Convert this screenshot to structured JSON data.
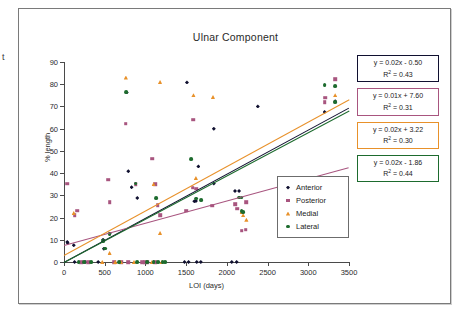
{
  "edge_fragment": "t",
  "chart_data": {
    "type": "scatter",
    "title": "Ulnar Component",
    "xlabel": "LOI (days)",
    "ylabel": "% length",
    "xlim": [
      0,
      3500
    ],
    "ylim": [
      0,
      90
    ],
    "xticks": [
      0,
      500,
      1000,
      1500,
      2000,
      2500,
      3000,
      3500
    ],
    "yticks": [
      0,
      10,
      20,
      30,
      40,
      50,
      60,
      70,
      80,
      90
    ],
    "grid": false,
    "legend_position": "inside-right",
    "series": [
      {
        "name": "Anterior",
        "marker": "diamond",
        "color": "#101030",
        "points": [
          [
            40,
            9
          ],
          [
            45,
            8.5
          ],
          [
            120,
            7.5
          ],
          [
            480,
            10
          ],
          [
            490,
            6
          ],
          [
            560,
            12.8
          ],
          [
            770,
            76.3
          ],
          [
            790,
            40.8
          ],
          [
            830,
            33.6
          ],
          [
            900,
            28.8
          ],
          [
            1510,
            80.8
          ],
          [
            1600,
            27.3
          ],
          [
            1620,
            27.5
          ],
          [
            1840,
            60
          ],
          [
            1840,
            35.3
          ],
          [
            2100,
            32
          ],
          [
            2150,
            32
          ],
          [
            2380,
            70
          ],
          [
            1650,
            43
          ],
          [
            3200,
            67.5
          ],
          [
            3330,
            72.3
          ],
          [
            1480,
            0
          ],
          [
            1530,
            0
          ],
          [
            1630,
            0
          ],
          [
            1680,
            0
          ],
          [
            2060,
            0
          ],
          [
            2120,
            0
          ],
          [
            130,
            0
          ],
          [
            260,
            0
          ],
          [
            420,
            0
          ]
        ]
      },
      {
        "name": "Posterior",
        "marker": "square",
        "color": "#a8557f",
        "points": [
          [
            40,
            35.3
          ],
          [
            160,
            23
          ],
          [
            130,
            21
          ],
          [
            560,
            27
          ],
          [
            540,
            37
          ],
          [
            760,
            62.3
          ],
          [
            880,
            35
          ],
          [
            1080,
            46.4
          ],
          [
            1120,
            35
          ],
          [
            1150,
            25.5
          ],
          [
            1180,
            21
          ],
          [
            1590,
            64
          ],
          [
            1580,
            33.5
          ],
          [
            1620,
            33
          ],
          [
            1500,
            23
          ],
          [
            1820,
            25.3
          ],
          [
            2100,
            26
          ],
          [
            2130,
            24
          ],
          [
            2240,
            27
          ],
          [
            2180,
            14
          ],
          [
            2230,
            14.5
          ],
          [
            3200,
            72
          ],
          [
            3210,
            74
          ],
          [
            3330,
            82.3
          ],
          [
            210,
            0
          ],
          [
            300,
            0
          ],
          [
            620,
            0
          ],
          [
            700,
            0
          ],
          [
            790,
            0
          ],
          [
            960,
            0
          ],
          [
            1000,
            0
          ],
          [
            1030,
            0
          ],
          [
            1120,
            0
          ]
        ]
      },
      {
        "name": "Medial",
        "marker": "triangle",
        "color": "#e8912a",
        "points": [
          [
            120,
            22
          ],
          [
            560,
            4
          ],
          [
            760,
            83
          ],
          [
            1180,
            81
          ],
          [
            1100,
            35
          ],
          [
            1180,
            13
          ],
          [
            1590,
            75
          ],
          [
            1620,
            37.8
          ],
          [
            1830,
            74.3
          ],
          [
            2180,
            22.5
          ],
          [
            2200,
            21
          ],
          [
            2240,
            19
          ],
          [
            3330,
            75
          ],
          [
            700,
            0
          ],
          [
            860,
            0
          ],
          [
            1080,
            0
          ],
          [
            1200,
            0
          ],
          [
            470,
            0
          ],
          [
            630,
            0
          ]
        ]
      },
      {
        "name": "Lateral",
        "marker": "circle",
        "color": "#1d6b2e",
        "points": [
          [
            760,
            76.3
          ],
          [
            880,
            35.3
          ],
          [
            1130,
            28.8
          ],
          [
            1560,
            46.3
          ],
          [
            1620,
            28.5
          ],
          [
            1680,
            28
          ],
          [
            2150,
            29
          ],
          [
            2180,
            29
          ],
          [
            2180,
            23
          ],
          [
            2200,
            22.5
          ],
          [
            3200,
            79.5
          ],
          [
            3330,
            79.3
          ],
          [
            3330,
            71.8
          ],
          [
            480,
            9.5
          ],
          [
            500,
            6
          ],
          [
            560,
            12.6
          ],
          [
            250,
            0
          ],
          [
            330,
            0
          ],
          [
            680,
            0
          ],
          [
            900,
            0
          ],
          [
            1020,
            0
          ],
          [
            1100,
            0
          ],
          [
            1160,
            0
          ],
          [
            1210,
            0
          ],
          [
            1240,
            0
          ],
          [
            180,
            0
          ]
        ]
      }
    ],
    "trendlines": [
      {
        "name": "Anterior",
        "color": "#101030",
        "slope": 0.02,
        "intercept": -0.5,
        "r2": 0.43,
        "equation": "y = 0.02x - 0.50",
        "r2_label": "R² = 0.43"
      },
      {
        "name": "Posterior",
        "color": "#a8557f",
        "slope": 0.01,
        "intercept": 7.6,
        "r2": 0.31,
        "equation": "y = 0.01x + 7.60",
        "r2_label": "R² = 0.31"
      },
      {
        "name": "Medial",
        "color": "#e8912a",
        "slope": 0.02,
        "intercept": 3.22,
        "r2": 0.3,
        "equation": "y = 0.02x + 3.22",
        "r2_label": "R² = 0.30"
      },
      {
        "name": "Lateral",
        "color": "#1d6b2e",
        "slope": 0.02,
        "intercept": -1.86,
        "r2": 0.44,
        "equation": "y = 0.02x - 1.86",
        "r2_label": "R² = 0.44"
      }
    ]
  }
}
